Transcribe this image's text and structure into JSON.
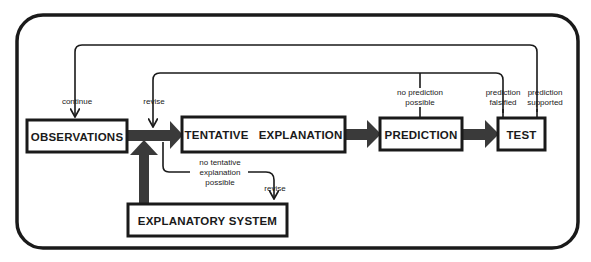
{
  "diagram": {
    "type": "flowchart",
    "nodes": {
      "observations": "OBSERVATIONS",
      "tentative_explanation": "TENTATIVE   EXPLANATION",
      "prediction": "PREDICTION",
      "test": "TEST",
      "explanatory_system": "EXPLANATORY SYSTEM"
    },
    "edge_labels": {
      "continue": "continue",
      "revise_top": "revise",
      "no_prediction_line1": "no prediction",
      "no_prediction_line2": "possible",
      "falsified_line1": "prediction",
      "falsified_line2": "falsified",
      "supported_line1": "prediction",
      "supported_line2": "supported",
      "no_tentative_line1": "no tentative",
      "no_tentative_line2": "explanation",
      "no_tentative_line3": "possible",
      "revise_bottom": "revise"
    },
    "colors": {
      "stroke": "#1a1a1a",
      "arrow_fill": "#3a3a3a",
      "background": "#ffffff"
    }
  }
}
